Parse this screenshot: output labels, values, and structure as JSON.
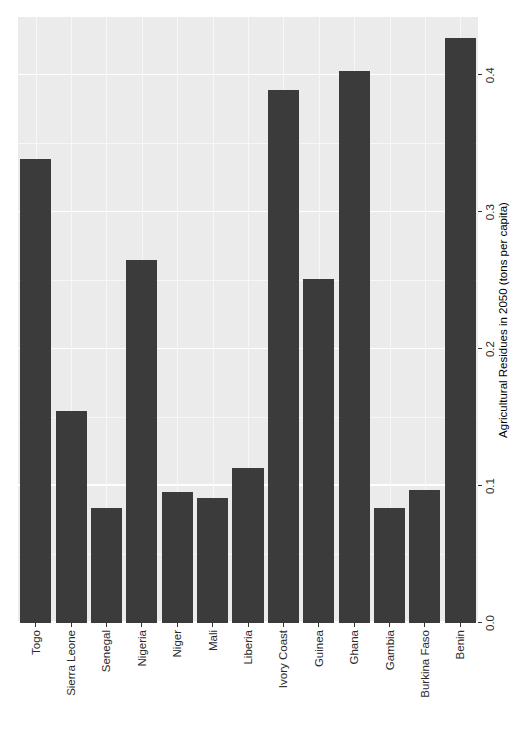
{
  "chart_data": {
    "type": "bar",
    "orientation": "horizontal",
    "title": "",
    "subtitle": "",
    "xlabel": "Agricultural Residues in 2050 (tons per capita)",
    "ylabel": "",
    "xlim": [
      0.0,
      0.4425
    ],
    "xticks": [
      0.0,
      0.1,
      0.2,
      0.3,
      0.4
    ],
    "xticklabels": [
      "0.0",
      "0.1",
      "0.2",
      "0.3",
      "0.4"
    ],
    "grid": true,
    "legend": null,
    "bar_color": "#3b3b3b",
    "panel_background": "#ebebeb",
    "gridline_color": "#ffffff",
    "categories": [
      "Togo",
      "Sierra Leone",
      "Senegal",
      "Nigeria",
      "Niger",
      "Mali",
      "Liberia",
      "Ivory Coast",
      "Guinea",
      "Ghana",
      "Gambia",
      "Burkina Faso",
      "Benin"
    ],
    "values": [
      0.339,
      0.155,
      0.084,
      0.265,
      0.096,
      0.091,
      0.113,
      0.389,
      0.251,
      0.403,
      0.084,
      0.097,
      0.427
    ],
    "series": [
      {
        "name": "Agricultural Residues in 2050 (tons per capita)",
        "values": [
          0.339,
          0.155,
          0.084,
          0.265,
          0.096,
          0.091,
          0.113,
          0.389,
          0.251,
          0.403,
          0.084,
          0.097,
          0.427
        ]
      }
    ]
  },
  "figure": {
    "rotation_degrees": -90,
    "background": "#ffffff"
  }
}
